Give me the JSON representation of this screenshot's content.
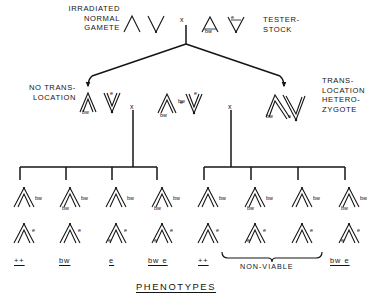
{
  "figure": {
    "title": "PHENOTYPES",
    "parent_row": {
      "left_label": "IRRADIATED\nNORMAL\nGAMETE",
      "cross_symbol": "x",
      "right_label": "TESTER-\nSTOCK",
      "irradiated_gamete_genes": [],
      "tester_stock_genes": [
        "bw",
        "e"
      ]
    },
    "f1_row": {
      "left_label": "NO TRANS-\nLOCATION",
      "right_label": "TRANS-\nLOCATION\nHETERO-\nZYGOTE",
      "cross_symbol": "x",
      "groups": [
        {
          "name": "no-translocation",
          "genes": [
            "bw",
            "e"
          ]
        },
        {
          "name": "tester-stock",
          "genes": [
            "bw",
            "bw",
            "e",
            "e"
          ]
        },
        {
          "name": "translocation-heterozygote",
          "genes": [
            "bw",
            "e"
          ]
        }
      ]
    },
    "offspring": {
      "left_group": [
        {
          "top_genes": [
            "bw"
          ],
          "bottom_genes": [
            "e"
          ],
          "phenotype": "++"
        },
        {
          "top_genes": [
            "bw",
            "bw"
          ],
          "bottom_genes": [
            "e"
          ],
          "phenotype": "bw"
        },
        {
          "top_genes": [
            "bw"
          ],
          "bottom_genes": [
            "e",
            "e"
          ],
          "phenotype": "e"
        },
        {
          "top_genes": [
            "bw",
            "bw"
          ],
          "bottom_genes": [
            "e",
            "e"
          ],
          "phenotype": "bw e"
        }
      ],
      "right_group": [
        {
          "top_genes": [
            "bw"
          ],
          "bottom_genes": [
            "e"
          ],
          "phenotype": "++"
        },
        {
          "top_genes": [
            "bw",
            "bw"
          ],
          "bottom_genes": [
            "e",
            "e"
          ],
          "phenotype": ""
        },
        {
          "top_genes": [
            "bw"
          ],
          "bottom_genes": [
            "e"
          ],
          "phenotype": ""
        },
        {
          "top_genes": [
            "bw",
            "bw"
          ],
          "bottom_genes": [
            "e",
            "e"
          ],
          "phenotype": "bw e"
        }
      ],
      "nonviable_label": "NON-VIABLE"
    },
    "colors": {
      "ink": "#141414",
      "background": "#ffffff"
    }
  }
}
